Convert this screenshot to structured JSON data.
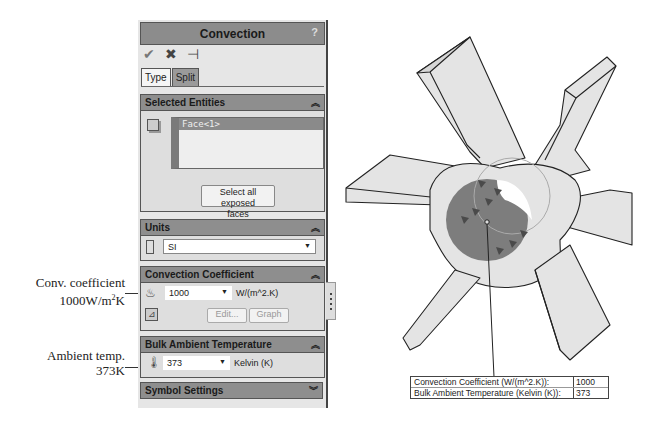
{
  "annotations": {
    "conv_coefficient": {
      "line1": "Conv. coefficient",
      "line2_prefix": "1000W/m",
      "line2_sup": "2",
      "line2_suffix": "K"
    },
    "ambient_temp": {
      "line1": "Ambient temp.",
      "line2": "373K"
    }
  },
  "panel": {
    "title": "Convection",
    "help_icon": "?",
    "toolbar": {
      "ok_icon": "✔",
      "cancel_icon": "✖",
      "pin_icon": "⊣"
    },
    "tabs": [
      {
        "label": "Type",
        "active": true
      },
      {
        "label": "Split",
        "active": false
      }
    ],
    "sections": {
      "selected_entities": {
        "header": "Selected Entities",
        "chevron": "⌃",
        "items": [
          "Face<1>"
        ],
        "select_all_button": {
          "line1": "Select all exposed",
          "line2": "faces"
        }
      },
      "units": {
        "header": "Units",
        "selected": "SI"
      },
      "convection_coefficient": {
        "header": "Convection Coefficient",
        "value": "1000",
        "unit": "W/(m^2.K)",
        "edit_button": "Edit...",
        "graph_button": "Graph"
      },
      "bulk_ambient_temperature": {
        "header": "Bulk Ambient Temperature",
        "value": "373",
        "unit": "Kelvin (K)"
      },
      "symbol_settings": {
        "header": "Symbol Settings"
      }
    }
  },
  "viewport": {
    "callout": {
      "rows": [
        {
          "label": "Convection Coefficient (W/(m^2.K)):",
          "value": "1000"
        },
        {
          "label": "Bulk Ambient Temperature (Kelvin (K)):",
          "value": "373"
        }
      ]
    },
    "colors": {
      "part_fill": "#e4e4e4",
      "selected_face": "#7d7d7d",
      "edges": "#222222",
      "symbol": "#4a4a4a"
    }
  }
}
